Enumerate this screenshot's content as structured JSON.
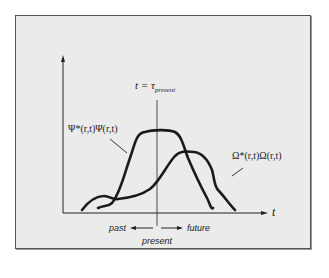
{
  "figure": {
    "time_marker_label": "t = τ",
    "time_marker_subscript": "present",
    "curve1_label": "Ψ*(r,t)Ψ(r,t)",
    "curve2_label": "Ω*(r,t)Ω(r,t)",
    "x_axis_label": "t",
    "past_label": "past",
    "future_label": "future",
    "present_label": "present"
  },
  "colors": {
    "background": "#ebebeb",
    "frame_border": "#555555",
    "curve": "#1a1a1a",
    "text": "#222222"
  }
}
